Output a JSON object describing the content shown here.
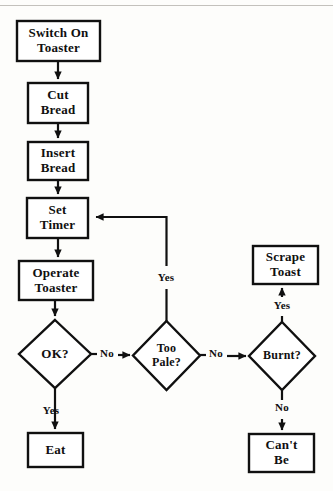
{
  "diagram": {
    "background_color": "#fdfdfb",
    "stroke_color": "#101010",
    "fill_color": "#ffffff",
    "nodes": [
      {
        "id": "switch-on-toaster",
        "shape": "process",
        "line1": "Switch On",
        "line2": "Toaster",
        "x": 17,
        "y": 21,
        "w": 83,
        "h": 40,
        "font_size": 13
      },
      {
        "id": "cut-bread",
        "shape": "process",
        "line1": "Cut",
        "line2": "Bread",
        "x": 28,
        "y": 83,
        "w": 60,
        "h": 40,
        "font_size": 13
      },
      {
        "id": "insert-bread",
        "shape": "process",
        "line1": "Insert",
        "line2": "Bread",
        "x": 28,
        "y": 142,
        "w": 60,
        "h": 38,
        "font_size": 13
      },
      {
        "id": "set-timer",
        "shape": "process",
        "line1": "Set",
        "line2": "Timer",
        "x": 27,
        "y": 198,
        "w": 61,
        "h": 40,
        "font_size": 13
      },
      {
        "id": "operate-toaster",
        "shape": "process",
        "line1": "Operate",
        "line2": "Toaster",
        "x": 19,
        "y": 261,
        "w": 74,
        "h": 39,
        "font_size": 13
      },
      {
        "id": "ok-decision",
        "shape": "decision",
        "line1": "OK?",
        "line2": "",
        "x": 19,
        "y": 320,
        "w": 72,
        "h": 68,
        "font_size": 13
      },
      {
        "id": "too-pale-decision",
        "shape": "decision",
        "line1": "Too",
        "line2": "Pale?",
        "x": 133,
        "y": 321,
        "w": 67,
        "h": 69,
        "font_size": 12
      },
      {
        "id": "burnt-decision",
        "shape": "decision",
        "line1": "Burnt?",
        "line2": "",
        "x": 249,
        "y": 322,
        "w": 66,
        "h": 68,
        "font_size": 12
      },
      {
        "id": "scrape-toast",
        "shape": "process",
        "line1": "Scrape",
        "line2": "Toast",
        "x": 253,
        "y": 246,
        "w": 65,
        "h": 38,
        "font_size": 13
      },
      {
        "id": "eat",
        "shape": "process",
        "line1": "Eat",
        "line2": "",
        "x": 28,
        "y": 433,
        "w": 55,
        "h": 34,
        "font_size": 13
      },
      {
        "id": "cant-be",
        "shape": "process",
        "line1": "Can't",
        "line2": "Be",
        "x": 249,
        "y": 434,
        "w": 65,
        "h": 38,
        "font_size": 13
      }
    ],
    "edge_labels": [
      {
        "id": "ok-no-label",
        "text": "No",
        "x": 96,
        "y": 347,
        "w": 22,
        "font_size": 11
      },
      {
        "id": "ok-yes-label",
        "text": "Yes",
        "x": 36,
        "y": 404,
        "w": 30,
        "font_size": 11
      },
      {
        "id": "too-pale-yes-label",
        "text": "Yes",
        "x": 151,
        "y": 273,
        "w": 30,
        "font_size": 11
      },
      {
        "id": "too-pale-no-label",
        "text": "No",
        "x": 205,
        "y": 347,
        "w": 22,
        "font_size": 11
      },
      {
        "id": "burnt-yes-label",
        "text": "Yes",
        "x": 267,
        "y": 300,
        "w": 30,
        "font_size": 11
      },
      {
        "id": "burnt-no-label",
        "text": "No",
        "x": 271,
        "y": 405,
        "w": 22,
        "font_size": 11
      }
    ],
    "connectors": [
      {
        "id": "switch-to-cut",
        "from": "switch-on-toaster",
        "to": "cut-bread",
        "kind": "straight-down"
      },
      {
        "id": "cut-to-insert",
        "from": "cut-bread",
        "to": "insert-bread",
        "kind": "straight-down"
      },
      {
        "id": "insert-to-set-timer",
        "from": "insert-bread",
        "to": "set-timer",
        "kind": "straight-down"
      },
      {
        "id": "set-timer-to-operate",
        "from": "set-timer",
        "to": "operate-toaster",
        "kind": "straight-down"
      },
      {
        "id": "operate-to-ok",
        "from": "operate-toaster",
        "to": "ok-decision",
        "kind": "straight-down"
      },
      {
        "id": "ok-no-to-too-pale",
        "from": "ok-decision",
        "to": "too-pale-decision",
        "kind": "straight-right",
        "label": "No"
      },
      {
        "id": "ok-yes-to-eat",
        "from": "ok-decision",
        "to": "eat",
        "kind": "straight-down",
        "label": "Yes"
      },
      {
        "id": "too-pale-yes-to-set-timer",
        "from": "too-pale-decision",
        "to": "set-timer",
        "kind": "up-then-left",
        "label": "Yes"
      },
      {
        "id": "too-pale-no-to-burnt",
        "from": "too-pale-decision",
        "to": "burnt-decision",
        "kind": "straight-right",
        "label": "No"
      },
      {
        "id": "burnt-yes-to-scrape",
        "from": "burnt-decision",
        "to": "scrape-toast",
        "kind": "straight-up",
        "label": "Yes"
      },
      {
        "id": "burnt-no-to-cant-be",
        "from": "burnt-decision",
        "to": "cant-be",
        "kind": "straight-down",
        "label": "No"
      }
    ]
  }
}
